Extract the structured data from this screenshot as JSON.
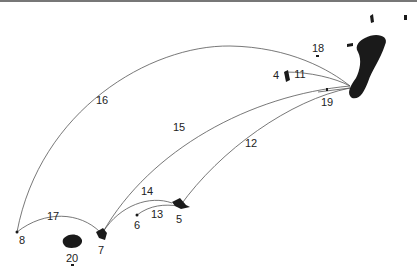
{
  "map": {
    "colors": {
      "land": "#1a1a1a",
      "route": "#555555",
      "text": "#222222",
      "background": "#ffffff"
    },
    "hub": {
      "name": "hub",
      "x": 352,
      "y": 86
    },
    "routes": [
      {
        "id": "11",
        "label": "11",
        "label_x": 300,
        "label_y": 74
      },
      {
        "id": "12",
        "label": "12",
        "label_x": 251,
        "label_y": 143
      },
      {
        "id": "14",
        "label": "14",
        "label_x": 147,
        "label_y": 191
      },
      {
        "id": "15",
        "label": "15",
        "label_x": 179,
        "label_y": 127
      },
      {
        "id": "16",
        "label": "16",
        "label_x": 102,
        "label_y": 100
      },
      {
        "id": "17",
        "label": "17",
        "label_x": 53,
        "label_y": 216
      },
      {
        "id": "13",
        "label": "13",
        "label_x": 157,
        "label_y": 214
      }
    ],
    "places": [
      {
        "id": "4",
        "label": "4",
        "label_x": 276,
        "label_y": 75
      },
      {
        "id": "5",
        "label": "5",
        "label_x": 179,
        "label_y": 219
      },
      {
        "id": "6",
        "label": "6",
        "label_x": 137,
        "label_y": 225
      },
      {
        "id": "7",
        "label": "7",
        "label_x": 101,
        "label_y": 250
      },
      {
        "id": "8",
        "label": "8",
        "label_x": 22,
        "label_y": 240
      },
      {
        "id": "18",
        "label": "18",
        "label_x": 318,
        "label_y": 48
      },
      {
        "id": "19",
        "label": "19",
        "label_x": 327,
        "label_y": 102
      },
      {
        "id": "20",
        "label": "20",
        "label_x": 72,
        "label_y": 258
      }
    ]
  }
}
